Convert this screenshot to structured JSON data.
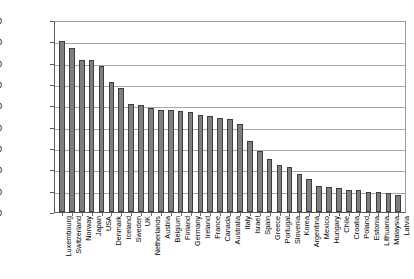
{
  "chart_data": {
    "type": "bar",
    "title": "",
    "subtitle": "",
    "xlabel": "",
    "ylabel": "",
    "ylim": [
      0,
      45000
    ],
    "ytick_step": 5000,
    "grid": true,
    "legend": false,
    "legend_position": "none",
    "bar_color": "#7f7f7f",
    "bar_edge_color": "#3d3d3d",
    "axis_color": "#5a5a5a",
    "gridline_color": "#a8a8a8",
    "ytick_labels": [
      "45,000",
      "40,000",
      "35,000",
      "30,000",
      "25,000",
      "20,000",
      "15,000",
      "10,000",
      "5,000",
      "0"
    ],
    "ytick_values": [
      45000,
      40000,
      35000,
      30000,
      25000,
      20000,
      15000,
      10000,
      5000,
      0
    ],
    "categories": [
      "Luxembourg",
      "Switzerland",
      "Norway",
      "Japan",
      "USA",
      "Denmark",
      "Iceland",
      "Sweden",
      "UK",
      "Netherlands",
      "Austria",
      "Belgium",
      "Finland",
      "Germany",
      "Ireland",
      "France",
      "Canada",
      "Australia",
      "Italy",
      "Israel",
      "Spain",
      "Greece",
      "Portugal",
      "Slovenia",
      "Korea",
      "Argentina",
      "Mexico",
      "Hungary",
      "Chile",
      "Croatia",
      "Poland",
      "Estonia",
      "Lithuania",
      "Malaysia",
      "Latvia"
    ],
    "values": [
      40000,
      38400,
      35600,
      35600,
      34300,
      30500,
      29000,
      25300,
      25100,
      24300,
      23900,
      23800,
      23700,
      23500,
      22700,
      22600,
      22000,
      21800,
      20700,
      16700,
      14400,
      12500,
      11000,
      10600,
      9000,
      7700,
      6200,
      5900,
      5700,
      5200,
      5100,
      4800,
      4700,
      4400,
      4100
    ]
  }
}
